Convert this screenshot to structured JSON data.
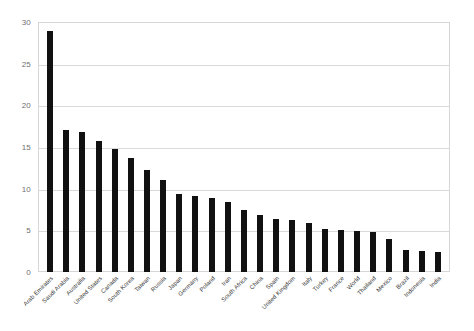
{
  "chart_data": {
    "type": "bar",
    "title": "",
    "subtitle": "",
    "xlabel": "",
    "ylabel": "",
    "ylim": [
      0,
      30
    ],
    "ytick_values": [
      0,
      5,
      10,
      15,
      20,
      25,
      30
    ],
    "ytick_labels": [
      "0",
      "5",
      "10",
      "15",
      "20",
      "25",
      "30"
    ],
    "grid": true,
    "legend": false,
    "legend_position": "none",
    "bar_color": "#111111",
    "gridline_color": "#d9d9d9",
    "plot_border_color": "#d6d6d6",
    "categories": [
      "Arab Emirates",
      "Saudi Arabia",
      "Australia",
      "United States",
      "Canada",
      "South Korea",
      "Taiwan",
      "Russia",
      "Japan",
      "Germany",
      "Poland",
      "Iran",
      "South Africa",
      "China",
      "Spain",
      "United Kingdom",
      "Italy",
      "Turkey",
      "France",
      "World",
      "Thailand",
      "Mexico",
      "Brazil",
      "Indonesia",
      "India"
    ],
    "values": [
      28.9,
      17.0,
      16.8,
      15.7,
      14.8,
      13.7,
      12.3,
      11.0,
      9.4,
      9.1,
      8.9,
      8.4,
      7.4,
      6.9,
      6.4,
      6.2,
      5.9,
      5.2,
      5.1,
      4.9,
      4.8,
      4.0,
      2.6,
      2.5,
      2.4
    ]
  }
}
